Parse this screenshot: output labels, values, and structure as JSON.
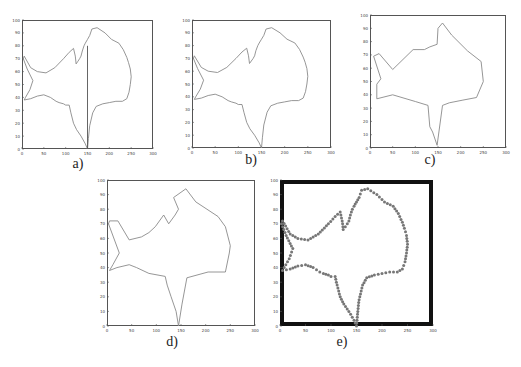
{
  "figure": {
    "panels": [
      {
        "id": "a",
        "caption": "a)",
        "frame": [
          22,
          20,
          131,
          129
        ],
        "caption_pos": [
          78,
          156
        ],
        "style": "line",
        "border": 1,
        "border_color": "#555555",
        "line_color": "#8a8a8a",
        "extra_segment": true
      },
      {
        "id": "b",
        "caption": "b)",
        "frame": [
          192,
          20,
          139,
          128
        ],
        "caption_pos": [
          251,
          152
        ],
        "style": "line",
        "border": 1,
        "border_color": "#555555",
        "line_color": "#8a8a8a",
        "extra_segment": false
      },
      {
        "id": "c",
        "caption": "c)",
        "frame": [
          370,
          15,
          136,
          133
        ],
        "caption_pos": [
          430,
          152
        ],
        "style": "polygon",
        "border": 1,
        "border_color": "#555555",
        "line_color": "#8a8a8a",
        "extra_segment": false
      },
      {
        "id": "d",
        "caption": "d)",
        "frame": [
          107,
          180,
          148,
          146
        ],
        "caption_pos": [
          172,
          334
        ],
        "style": "polygon",
        "border": 1,
        "border_color": "#555555",
        "line_color": "#8a8a8a",
        "extra_segment": false
      },
      {
        "id": "e",
        "caption": "e)",
        "frame": [
          280,
          180,
          153,
          146
        ],
        "caption_pos": [
          342,
          334
        ],
        "style": "dots",
        "border": 4,
        "border_color": "#111111",
        "line_color": "#777777",
        "extra_segment": false
      }
    ]
  },
  "chart_data": [
    {
      "type": "line",
      "panel": "a",
      "title": "",
      "caption": "a)",
      "xlabel": "",
      "ylabel": "",
      "xlim": [
        0,
        300
      ],
      "ylim": [
        0,
        100
      ],
      "xticks": [
        0,
        50,
        100,
        150,
        200,
        250,
        300
      ],
      "yticks": [
        0,
        10,
        20,
        30,
        40,
        50,
        60,
        70,
        80,
        90,
        100
      ],
      "grid": false,
      "description": "Raw fish contour with a vertical connecting segment at x≈150 from y≈0 to y≈80",
      "series": [
        {
          "name": "contour",
          "x": [
            150,
            152,
            155,
            162,
            170,
            185,
            200,
            215,
            230,
            240,
            245,
            248,
            250,
            248,
            244,
            240,
            232,
            222,
            205,
            190,
            172,
            160,
            155,
            150,
            145,
            142,
            138,
            135,
            132,
            128,
            124,
            122,
            118,
            108,
            95,
            75,
            55,
            35,
            20,
            5,
            3,
            12,
            25,
            18,
            8,
            5,
            20,
            35,
            50,
            65,
            78,
            85,
            95,
            100,
            108,
            112,
            118,
            125,
            135,
            145,
            150
          ],
          "y": [
            0,
            8,
            18,
            28,
            33,
            35,
            36,
            37,
            37,
            39,
            44,
            50,
            56,
            62,
            67,
            71,
            77,
            82,
            85,
            90,
            94,
            93,
            88,
            85,
            82,
            80,
            76,
            72,
            70,
            68,
            66,
            72,
            78,
            75,
            70,
            63,
            59,
            60,
            63,
            72,
            70,
            62,
            53,
            46,
            40,
            38,
            39,
            41,
            42,
            40,
            37,
            36,
            35,
            34,
            34,
            28,
            20,
            15,
            10,
            4,
            0
          ]
        },
        {
          "name": "connector",
          "x": [
            150,
            150
          ],
          "y": [
            0,
            80
          ]
        }
      ]
    },
    {
      "type": "line",
      "panel": "b",
      "caption": "b)",
      "xlim": [
        0,
        300
      ],
      "ylim": [
        0,
        100
      ],
      "xticks": [
        0,
        50,
        100,
        150,
        200,
        250,
        300
      ],
      "yticks": [
        0,
        10,
        20,
        30,
        40,
        50,
        60,
        70,
        80,
        90,
        100
      ],
      "description": "Raw fish contour without connector"
    },
    {
      "type": "line",
      "panel": "c",
      "caption": "c)",
      "xlim": [
        0,
        300
      ],
      "ylim": [
        0,
        100
      ],
      "xticks": [
        0,
        50,
        100,
        150,
        200,
        250,
        300
      ],
      "yticks": [
        0,
        10,
        20,
        30,
        40,
        50,
        60,
        70,
        80,
        90,
        100
      ],
      "description": "Coarse polygon approximation",
      "series": [
        {
          "name": "polygon",
          "x": [
            148,
            160,
            175,
            205,
            235,
            250,
            245,
            215,
            180,
            160,
            150,
            148,
            132,
            120,
            95,
            50,
            20,
            8,
            24,
            15,
            15,
            50,
            100,
            128,
            132,
            138,
            148
          ],
          "y": [
            2,
            32,
            34,
            36,
            38,
            50,
            65,
            73,
            85,
            94,
            90,
            78,
            76,
            74,
            74,
            59,
            71,
            69,
            52,
            48,
            37,
            40,
            35,
            32,
            16,
            12,
            2
          ]
        }
      ]
    },
    {
      "type": "line",
      "panel": "d",
      "caption": "d)",
      "xlim": [
        0,
        300
      ],
      "ylim": [
        0,
        100
      ],
      "xticks": [
        0,
        50,
        100,
        150,
        200,
        250,
        300
      ],
      "yticks": [
        0,
        10,
        20,
        30,
        40,
        50,
        60,
        70,
        80,
        90,
        100
      ],
      "description": "Intermediate polygon approximation",
      "series": [
        {
          "name": "polygon",
          "x": [
            145,
            152,
            162,
            205,
            240,
            248,
            250,
            240,
            225,
            180,
            160,
            135,
            145,
            138,
            125,
            115,
            98,
            85,
            70,
            45,
            22,
            5,
            3,
            25,
            12,
            5,
            20,
            45,
            60,
            85,
            118,
            122,
            130,
            140,
            145
          ],
          "y": [
            0,
            15,
            33,
            37,
            37,
            50,
            55,
            68,
            75,
            85,
            94,
            88,
            80,
            76,
            70,
            76,
            68,
            64,
            61,
            59,
            72,
            72,
            70,
            50,
            42,
            38,
            40,
            42,
            40,
            36,
            34,
            28,
            20,
            10,
            0
          ]
        }
      ]
    },
    {
      "type": "scatter",
      "panel": "e",
      "caption": "e)",
      "xlim": [
        0,
        300
      ],
      "ylim": [
        0,
        100
      ],
      "xticks": [
        0,
        50,
        100,
        150,
        200,
        250,
        300
      ],
      "yticks": [
        0,
        10,
        20,
        30,
        40,
        50,
        60,
        70,
        80,
        90,
        100
      ],
      "description": "Sampled contour points (dotted markers) with thick black frame"
    }
  ],
  "shape": {
    "outline": [
      [
        150,
        0
      ],
      [
        152,
        8
      ],
      [
        155,
        18
      ],
      [
        162,
        28
      ],
      [
        170,
        33
      ],
      [
        185,
        35
      ],
      [
        200,
        36
      ],
      [
        215,
        37
      ],
      [
        230,
        37
      ],
      [
        240,
        39
      ],
      [
        245,
        44
      ],
      [
        248,
        50
      ],
      [
        250,
        56
      ],
      [
        248,
        62
      ],
      [
        244,
        67
      ],
      [
        240,
        71
      ],
      [
        232,
        77
      ],
      [
        222,
        82
      ],
      [
        205,
        85
      ],
      [
        190,
        90
      ],
      [
        172,
        94
      ],
      [
        160,
        93
      ],
      [
        155,
        88
      ],
      [
        150,
        85
      ],
      [
        145,
        82
      ],
      [
        142,
        80
      ],
      [
        138,
        76
      ],
      [
        135,
        72
      ],
      [
        132,
        70
      ],
      [
        128,
        68
      ],
      [
        124,
        66
      ],
      [
        122,
        72
      ],
      [
        118,
        78
      ],
      [
        108,
        75
      ],
      [
        95,
        70
      ],
      [
        75,
        63
      ],
      [
        55,
        59
      ],
      [
        35,
        60
      ],
      [
        20,
        63
      ],
      [
        5,
        72
      ],
      [
        3,
        70
      ],
      [
        12,
        62
      ],
      [
        25,
        53
      ],
      [
        18,
        46
      ],
      [
        8,
        40
      ],
      [
        5,
        38
      ],
      [
        20,
        39
      ],
      [
        35,
        41
      ],
      [
        50,
        42
      ],
      [
        65,
        40
      ],
      [
        78,
        37
      ],
      [
        85,
        36
      ],
      [
        95,
        35
      ],
      [
        100,
        34
      ],
      [
        108,
        34
      ],
      [
        112,
        28
      ],
      [
        118,
        20
      ],
      [
        125,
        15
      ],
      [
        135,
        10
      ],
      [
        145,
        4
      ],
      [
        150,
        0
      ]
    ],
    "polygon_c": [
      [
        148,
        2
      ],
      [
        160,
        32
      ],
      [
        175,
        34
      ],
      [
        205,
        36
      ],
      [
        235,
        38
      ],
      [
        250,
        50
      ],
      [
        245,
        65
      ],
      [
        215,
        73
      ],
      [
        180,
        85
      ],
      [
        160,
        94
      ],
      [
        150,
        90
      ],
      [
        148,
        78
      ],
      [
        132,
        76
      ],
      [
        120,
        74
      ],
      [
        95,
        74
      ],
      [
        50,
        59
      ],
      [
        20,
        71
      ],
      [
        8,
        69
      ],
      [
        24,
        52
      ],
      [
        15,
        48
      ],
      [
        15,
        37
      ],
      [
        50,
        40
      ],
      [
        100,
        35
      ],
      [
        128,
        32
      ],
      [
        132,
        16
      ],
      [
        138,
        12
      ],
      [
        148,
        2
      ]
    ],
    "polygon_d": [
      [
        145,
        0
      ],
      [
        152,
        15
      ],
      [
        162,
        33
      ],
      [
        205,
        37
      ],
      [
        240,
        37
      ],
      [
        248,
        50
      ],
      [
        250,
        55
      ],
      [
        240,
        68
      ],
      [
        225,
        75
      ],
      [
        180,
        85
      ],
      [
        160,
        94
      ],
      [
        135,
        88
      ],
      [
        145,
        80
      ],
      [
        138,
        76
      ],
      [
        125,
        70
      ],
      [
        115,
        76
      ],
      [
        98,
        68
      ],
      [
        85,
        64
      ],
      [
        70,
        61
      ],
      [
        45,
        59
      ],
      [
        22,
        72
      ],
      [
        5,
        72
      ],
      [
        3,
        70
      ],
      [
        25,
        50
      ],
      [
        12,
        42
      ],
      [
        5,
        38
      ],
      [
        20,
        40
      ],
      [
        45,
        42
      ],
      [
        60,
        40
      ],
      [
        85,
        36
      ],
      [
        118,
        34
      ],
      [
        122,
        28
      ],
      [
        130,
        20
      ],
      [
        140,
        10
      ],
      [
        145,
        0
      ]
    ]
  }
}
